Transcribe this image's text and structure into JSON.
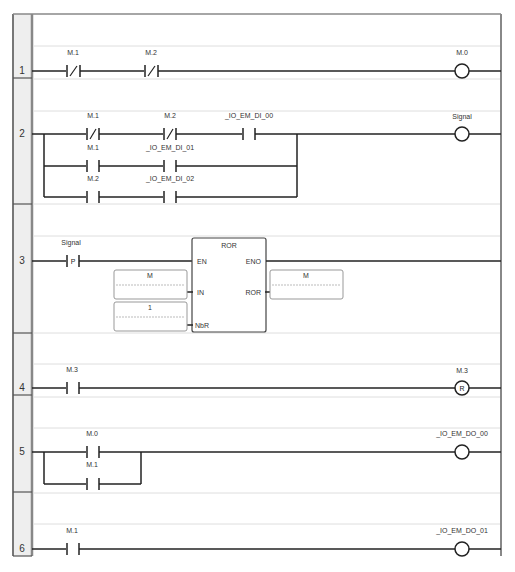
{
  "diagram": {
    "type": "ladder-logic",
    "rungs": [
      {
        "number": "1",
        "elements": [
          {
            "kind": "contact-nc",
            "label": "M.1"
          },
          {
            "kind": "contact-nc",
            "label": "M.2"
          },
          {
            "kind": "coil",
            "label": "M.0"
          }
        ]
      },
      {
        "number": "2",
        "branches": [
          [
            {
              "kind": "contact-nc",
              "label": "M.1"
            },
            {
              "kind": "contact-nc",
              "label": "M.2"
            },
            {
              "kind": "contact-no",
              "label": "_IO_EM_DI_00"
            }
          ],
          [
            {
              "kind": "contact-no",
              "label": "M.1"
            },
            {
              "kind": "contact-no",
              "label": "_IO_EM_DI_01"
            }
          ],
          [
            {
              "kind": "contact-no",
              "label": "M.2"
            },
            {
              "kind": "contact-no",
              "label": "_IO_EM_DI_02"
            }
          ]
        ],
        "output": {
          "kind": "coil",
          "label": "Signal"
        }
      },
      {
        "number": "3",
        "elements": [
          {
            "kind": "contact-positive-edge",
            "label": "Signal",
            "glyph": "P"
          }
        ],
        "function_block": {
          "name": "ROR",
          "inputs": [
            "EN",
            "IN",
            "NbR"
          ],
          "outputs": [
            "ENO",
            "ROR"
          ],
          "in_value": "M",
          "nbr_value": "1",
          "out_value": "M"
        }
      },
      {
        "number": "4",
        "elements": [
          {
            "kind": "contact-no",
            "label": "M.3"
          },
          {
            "kind": "coil-reset",
            "label": "M.3",
            "glyph": "R"
          }
        ]
      },
      {
        "number": "5",
        "branches": [
          [
            {
              "kind": "contact-no",
              "label": "M.0"
            }
          ],
          [
            {
              "kind": "contact-no",
              "label": "M.1"
            }
          ]
        ],
        "output": {
          "kind": "coil",
          "label": "_IO_EM_DO_00"
        }
      },
      {
        "number": "6",
        "elements": [
          {
            "kind": "contact-no",
            "label": "M.1"
          },
          {
            "kind": "coil",
            "label": "_IO_EM_DO_01"
          }
        ]
      }
    ]
  },
  "colors": {
    "line": "#222222",
    "rail": "#777777",
    "gutter": "#eeeeee",
    "grid": "#cccccc",
    "text": "#333333"
  }
}
